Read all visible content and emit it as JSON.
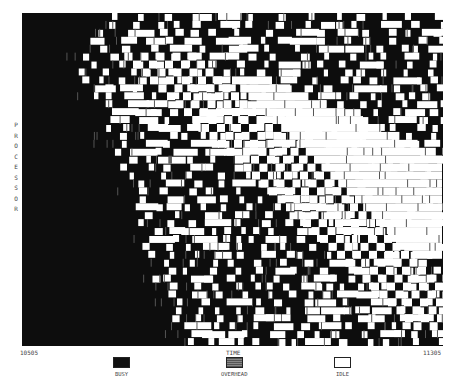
{
  "chart_data": {
    "type": "heatmap",
    "title": "",
    "xlabel": "TIME",
    "ylabel": "PROCESSOR",
    "x_range": [
      10505,
      11305
    ],
    "x_ticks": [
      "10505",
      "11305"
    ],
    "rows": 42,
    "states": [
      "BUSY",
      "OVERHEAD",
      "IDLE"
    ],
    "legend": [
      {
        "label": "BUSY",
        "color": "#111111"
      },
      {
        "label": "OVERHEAD",
        "color": "#6e6e6e"
      },
      {
        "label": "IDLE",
        "color": "#ffffff"
      }
    ],
    "legend_position": "bottom",
    "grid": false
  },
  "axis": {
    "ylabel_chars": [
      "P",
      "R",
      "O",
      "C",
      "E",
      "S",
      "S",
      "O",
      "R"
    ],
    "x_start": "10505",
    "x_end": "11305",
    "x_title": "TIME"
  },
  "legend": {
    "busy": "BUSY",
    "overhead": "OVERHEAD",
    "idle": "IDLE"
  },
  "colors": {
    "busy": "#0d0d0d",
    "overhead": "#6e6e6e",
    "idle": "#ffffff"
  }
}
